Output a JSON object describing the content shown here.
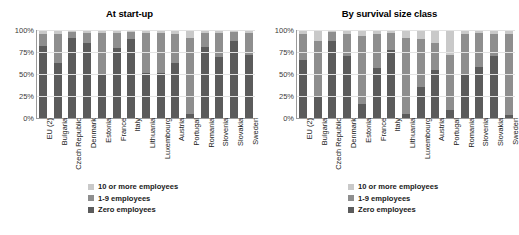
{
  "charts": [
    {
      "title": "At start-up",
      "legend": [
        {
          "label": "10 or more employees",
          "color": "#c9c9c9"
        },
        {
          "label": "1-9 employees",
          "color": "#8e8e8e"
        },
        {
          "label": "Zero employees",
          "color": "#5b5b5b"
        }
      ]
    },
    {
      "title": "By survival size class",
      "legend": [
        {
          "label": "10 or more employees",
          "color": "#c9c9c9"
        },
        {
          "label": "1-9 employees",
          "color": "#8e8e8e"
        },
        {
          "label": "Zero employees",
          "color": "#5b5b5b"
        }
      ]
    }
  ],
  "chart_data": [
    {
      "type": "bar",
      "stacked": true,
      "normalized": "100%",
      "title": "At start-up",
      "xlabel": "",
      "ylabel": "",
      "ylim": [
        0,
        100
      ],
      "yticks": [
        "0%",
        "25%",
        "50%",
        "75%",
        "100%"
      ],
      "grid": true,
      "legend_position": "bottom",
      "categories": [
        "EU (2)",
        "Bulgaria",
        "Czech Republic",
        "Denmark",
        "Estonia",
        "France",
        "Italy",
        "Lithuania",
        "Luxembourg",
        "Austria",
        "Portugal",
        "Romania",
        "Slovenia",
        "Slovakia",
        "Sweden"
      ],
      "series": [
        {
          "name": "Zero employees",
          "color": "#5b5b5b",
          "values": [
            82,
            63,
            91,
            85,
            50,
            80,
            90,
            51,
            51,
            63,
            4,
            81,
            69,
            87,
            72
          ]
        },
        {
          "name": "1-9 employees",
          "color": "#8e8e8e",
          "values": [
            14,
            33,
            7,
            12,
            47,
            17,
            8,
            46,
            46,
            33,
            87,
            16,
            28,
            11,
            25
          ]
        },
        {
          "name": "10 or more employees",
          "color": "#c9c9c9",
          "values": [
            4,
            4,
            2,
            3,
            3,
            3,
            2,
            3,
            3,
            4,
            9,
            3,
            3,
            2,
            3
          ]
        }
      ]
    },
    {
      "type": "bar",
      "stacked": true,
      "normalized": "100%",
      "title": "By survival size class",
      "xlabel": "",
      "ylabel": "",
      "ylim": [
        0,
        100
      ],
      "yticks": [
        "0%",
        "25%",
        "50%",
        "75%",
        "100%"
      ],
      "grid": true,
      "legend_position": "bottom",
      "categories": [
        "EU (2)",
        "Bulgaria",
        "Czech Republic",
        "Denmark",
        "Estonia",
        "France",
        "Italy",
        "Lithuania",
        "Luxembourg",
        "Austria",
        "Portugal",
        "Romania",
        "Slovenia",
        "Slovakia",
        "Sweden"
      ],
      "series": [
        {
          "name": "Zero employees",
          "color": "#5b5b5b",
          "values": [
            66,
            25,
            87,
            70,
            16,
            57,
            77,
            4,
            35,
            55,
            9,
            50,
            58,
            71,
            3
          ]
        },
        {
          "name": "1-9 employees",
          "color": "#8e8e8e",
          "values": [
            30,
            63,
            11,
            26,
            77,
            38,
            20,
            87,
            55,
            30,
            63,
            45,
            39,
            24,
            92
          ]
        },
        {
          "name": "10 or more employees",
          "color": "#c9c9c9",
          "values": [
            4,
            12,
            2,
            4,
            7,
            5,
            3,
            9,
            10,
            15,
            28,
            5,
            3,
            5,
            5
          ]
        }
      ]
    }
  ]
}
